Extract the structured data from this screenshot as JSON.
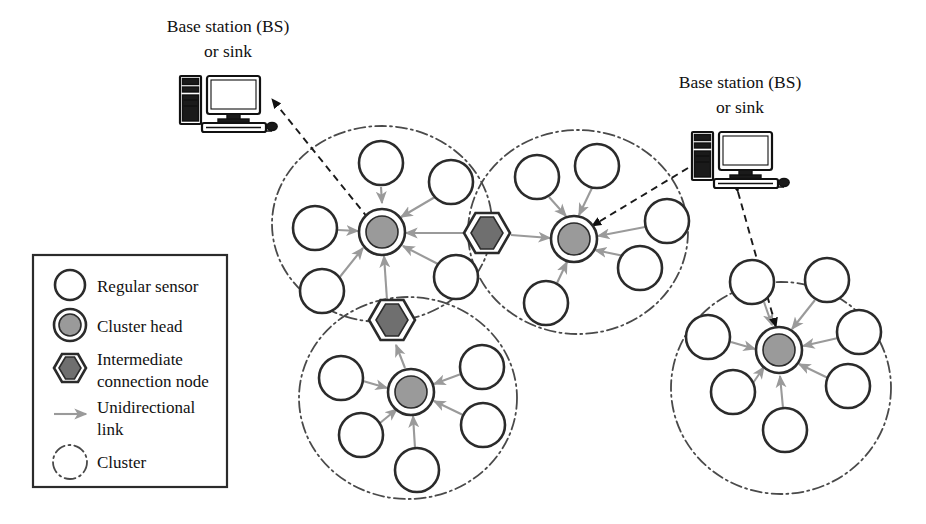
{
  "figure": {
    "type": "network-topology-diagram",
    "background_color": "#ffffff",
    "width": 926,
    "height": 524
  },
  "base_stations": [
    {
      "id": "bs-left",
      "label_line1": "Base station (BS)",
      "label_line2": "or sink",
      "icon": "desktop-computer-icon",
      "label_x": 228,
      "label_y1": 32,
      "label_y2": 57,
      "icon_x": 180,
      "icon_y": 76
    },
    {
      "id": "bs-right",
      "label_line1": "Base station (BS)",
      "label_line2": "or sink",
      "icon": "desktop-computer-icon",
      "label_x": 740,
      "label_y1": 88,
      "label_y2": 113,
      "icon_x": 692,
      "icon_y": 132
    }
  ],
  "legend": {
    "box": {
      "x": 33,
      "y": 255,
      "width": 194,
      "height": 232
    },
    "items": [
      {
        "symbol": "regular-sensor-icon",
        "label": "Regular sensor",
        "label2": ""
      },
      {
        "symbol": "cluster-head-icon",
        "label": "Cluster head",
        "label2": ""
      },
      {
        "symbol": "intermediate-node-icon",
        "label": "Intermediate",
        "label2": "connection node"
      },
      {
        "symbol": "unidirectional-arrow-icon",
        "label": "Unidirectional",
        "label2": "link"
      },
      {
        "symbol": "cluster-boundary-icon",
        "label": "Cluster",
        "label2": ""
      }
    ]
  },
  "colors": {
    "sensor_fill": "#ffffff",
    "sensor_stroke": "#2b2b2b",
    "cluster_head_fill": "#9a9a9a",
    "intermediate_node_fill": "#6f6f6f",
    "cluster_boundary_stroke": "#4a4a4a",
    "unidirectional_link": "#9a9a9a",
    "bs_link": "#1a1a1a"
  },
  "clusters": [
    {
      "id": "cluster-top-left",
      "boundary": {
        "cx": 382,
        "cy": 224,
        "rx": 110,
        "ry": 98
      },
      "cluster_head": {
        "id": "ch-top-left",
        "cx": 382,
        "cy": 232,
        "r": 22
      },
      "sensors": [
        {
          "id": "s-tl-1",
          "cx": 381,
          "cy": 163,
          "r": 22
        },
        {
          "id": "s-tl-2",
          "cx": 451,
          "cy": 182,
          "r": 22
        },
        {
          "id": "s-tl-3",
          "cx": 315,
          "cy": 228,
          "r": 22
        },
        {
          "id": "s-tl-4",
          "cx": 322,
          "cy": 291,
          "r": 22
        },
        {
          "id": "s-tl-5",
          "cx": 456,
          "cy": 277,
          "r": 22
        }
      ]
    },
    {
      "id": "cluster-top-right",
      "boundary": {
        "cx": 578,
        "cy": 232,
        "rx": 110,
        "ry": 102
      },
      "cluster_head": {
        "id": "ch-top-right",
        "cx": 574,
        "cy": 239,
        "r": 22
      },
      "sensors": [
        {
          "id": "s-tr-1",
          "cx": 537,
          "cy": 177,
          "r": 22
        },
        {
          "id": "s-tr-2",
          "cx": 597,
          "cy": 166,
          "r": 22
        },
        {
          "id": "s-tr-3",
          "cx": 667,
          "cy": 221,
          "r": 22
        },
        {
          "id": "s-tr-4",
          "cx": 640,
          "cy": 268,
          "r": 22
        },
        {
          "id": "s-tr-5",
          "cx": 546,
          "cy": 303,
          "r": 22
        }
      ]
    },
    {
      "id": "cluster-bottom-middle",
      "boundary": {
        "cx": 408,
        "cy": 398,
        "rx": 109,
        "ry": 101
      },
      "cluster_head": {
        "id": "ch-bottom-middle",
        "cx": 411,
        "cy": 392,
        "r": 22
      },
      "sensors": [
        {
          "id": "s-bm-1",
          "cx": 341,
          "cy": 378,
          "r": 22
        },
        {
          "id": "s-bm-2",
          "cx": 482,
          "cy": 367,
          "r": 22
        },
        {
          "id": "s-bm-3",
          "cx": 361,
          "cy": 435,
          "r": 22
        },
        {
          "id": "s-bm-4",
          "cx": 483,
          "cy": 425,
          "r": 22
        },
        {
          "id": "s-bm-5",
          "cx": 417,
          "cy": 470,
          "r": 22
        }
      ]
    },
    {
      "id": "cluster-bottom-right",
      "boundary": {
        "cx": 781,
        "cy": 388,
        "rx": 110,
        "ry": 106
      },
      "cluster_head": {
        "id": "ch-bottom-right",
        "cx": 779,
        "cy": 350,
        "r": 22
      },
      "sensors": [
        {
          "id": "s-br-1",
          "cx": 752,
          "cy": 282,
          "r": 22
        },
        {
          "id": "s-br-2",
          "cx": 827,
          "cy": 280,
          "r": 22
        },
        {
          "id": "s-br-3",
          "cx": 708,
          "cy": 337,
          "r": 22
        },
        {
          "id": "s-br-4",
          "cx": 859,
          "cy": 332,
          "r": 22
        },
        {
          "id": "s-br-5",
          "cx": 733,
          "cy": 392,
          "r": 22
        },
        {
          "id": "s-br-6",
          "cx": 848,
          "cy": 386,
          "r": 22
        },
        {
          "id": "s-br-7",
          "cx": 785,
          "cy": 430,
          "r": 22
        }
      ]
    }
  ],
  "intermediate_nodes": [
    {
      "id": "icn-middle",
      "cx": 487,
      "cy": 233,
      "r": 23
    },
    {
      "id": "icn-lower",
      "cx": 392,
      "cy": 320,
      "r": 23
    }
  ],
  "links": {
    "unidirectional_count": 24,
    "bs_links": [
      {
        "id": "bs-left-to-ch-top-left",
        "from": "ch-top-left",
        "to": "bs-left",
        "bidirectional": true
      },
      {
        "id": "bs-right-to-ch-top-right",
        "from": "bs-right",
        "to": "ch-top-right",
        "bidirectional": false
      },
      {
        "id": "bs-right-to-ch-bottom-right",
        "from": "bs-right",
        "to": "ch-bottom-right",
        "bidirectional": true
      }
    ]
  }
}
